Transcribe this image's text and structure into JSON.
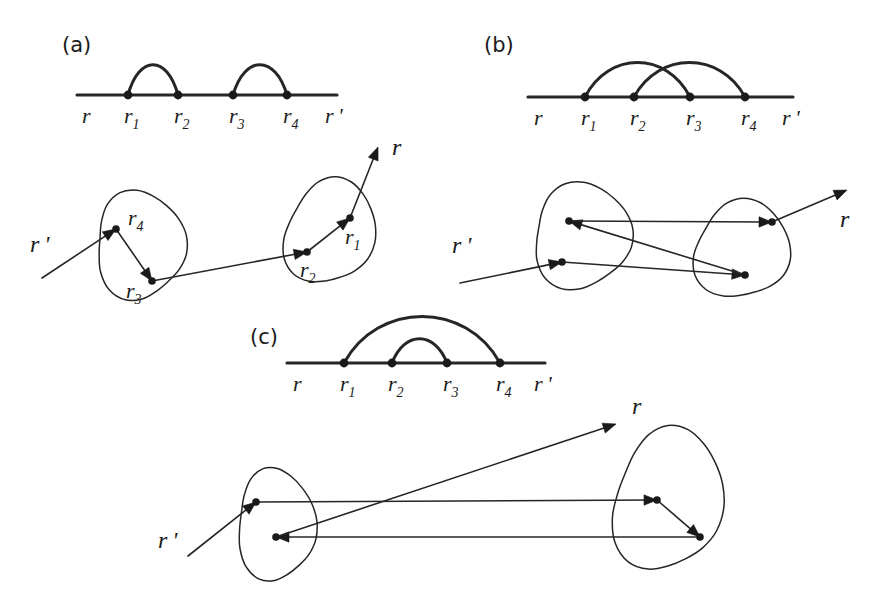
{
  "figure": {
    "background_color": "#ffffff",
    "ink_color": "#1a1a1a",
    "width": 886,
    "height": 602
  },
  "panels": [
    {
      "id": "a",
      "label": "(a)",
      "label_pos": {
        "x": 62,
        "y": 52
      },
      "topology": "non-crossing-sequential",
      "diagram": {
        "baseline": {
          "x1": 77,
          "y": 95,
          "x2": 337
        },
        "vertices": [
          {
            "name": "r1",
            "x": 128,
            "y": 95,
            "label": "r",
            "sub": "1",
            "label_x": 124,
            "label_y": 123
          },
          {
            "name": "r2",
            "x": 178,
            "y": 95,
            "label": "r",
            "sub": "2",
            "label_x": 174,
            "label_y": 123
          },
          {
            "name": "r3",
            "x": 233,
            "y": 95,
            "label": "r",
            "sub": "3",
            "label_x": 229,
            "label_y": 123
          },
          {
            "name": "r4",
            "x": 287,
            "y": 95,
            "label": "r",
            "sub": "4",
            "label_x": 283,
            "label_y": 123
          }
        ],
        "end_labels": [
          {
            "name": "r",
            "text": "r",
            "prime": false,
            "x": 82,
            "y": 123
          },
          {
            "name": "r-prime",
            "text": "r",
            "prime": true,
            "x": 325,
            "y": 123
          }
        ],
        "arcs": [
          {
            "from": "r1",
            "to": "r2",
            "height": 30
          },
          {
            "from": "r3",
            "to": "r4",
            "height": 30
          }
        ]
      },
      "scattering": {
        "blobs": [
          {
            "name": "left-blob",
            "cx": 140,
            "cy": 245,
            "rx": 46,
            "ry": 52,
            "rotate": -12,
            "wobble": 0.14
          },
          {
            "name": "right-blob",
            "cx": 330,
            "cy": 232,
            "rx": 45,
            "ry": 52,
            "rotate": 14,
            "wobble": 0.12
          }
        ],
        "sites": [
          {
            "name": "r4",
            "x": 116,
            "y": 229,
            "label": "r",
            "sub": "4",
            "label_x": 128,
            "label_y": 225
          },
          {
            "name": "r3",
            "x": 152,
            "y": 281,
            "label": "r",
            "sub": "3",
            "label_x": 126,
            "label_y": 298
          },
          {
            "name": "r2",
            "x": 307,
            "y": 252,
            "label": "r",
            "sub": "2",
            "label_x": 300,
            "label_y": 277
          },
          {
            "name": "r1",
            "x": 350,
            "y": 218,
            "label": "r",
            "sub": "1",
            "label_x": 345,
            "label_y": 244
          }
        ],
        "rays": [
          {
            "name": "incoming-ray",
            "x1": 42,
            "y1": 278,
            "x2": 116,
            "y2": 229,
            "arrow": true
          },
          {
            "name": "hop-r4-r3",
            "x1": 116,
            "y1": 229,
            "x2": 152,
            "y2": 281,
            "arrow": true
          },
          {
            "name": "hop-r3-r2",
            "x1": 152,
            "y1": 281,
            "x2": 307,
            "y2": 252,
            "arrow": true
          },
          {
            "name": "hop-r2-r1",
            "x1": 307,
            "y1": 252,
            "x2": 350,
            "y2": 218,
            "arrow": true
          },
          {
            "name": "outgoing-ray",
            "x1": 350,
            "y1": 218,
            "x2": 378,
            "y2": 147,
            "arrow": true
          }
        ],
        "end_labels": [
          {
            "name": "r-prime-in",
            "text": "r",
            "prime": true,
            "x": 30,
            "y": 252
          },
          {
            "name": "r-out",
            "text": "r",
            "prime": false,
            "x": 392,
            "y": 155
          }
        ]
      }
    },
    {
      "id": "b",
      "label": "(b)",
      "label_pos": {
        "x": 484,
        "y": 52
      },
      "topology": "crossing",
      "diagram": {
        "baseline": {
          "x1": 528,
          "y": 97,
          "x2": 793
        },
        "vertices": [
          {
            "name": "r1",
            "x": 585,
            "y": 97,
            "label": "r",
            "sub": "1",
            "label_x": 581,
            "label_y": 125
          },
          {
            "name": "r2",
            "x": 634,
            "y": 97,
            "label": "r",
            "sub": "2",
            "label_x": 630,
            "label_y": 125
          },
          {
            "name": "r3",
            "x": 690,
            "y": 97,
            "label": "r",
            "sub": "3",
            "label_x": 686,
            "label_y": 125
          },
          {
            "name": "r4",
            "x": 745,
            "y": 97,
            "label": "r",
            "sub": "4",
            "label_x": 741,
            "label_y": 125
          }
        ],
        "end_labels": [
          {
            "name": "r",
            "text": "r",
            "prime": false,
            "x": 534,
            "y": 125
          },
          {
            "name": "r-prime",
            "text": "r",
            "prime": true,
            "x": 782,
            "y": 125
          }
        ],
        "arcs": [
          {
            "from": "r1",
            "to": "r3",
            "height": 34
          },
          {
            "from": "r2",
            "to": "r4",
            "height": 34
          }
        ]
      },
      "scattering": {
        "blobs": [
          {
            "name": "left-blob",
            "cx": 582,
            "cy": 236,
            "rx": 50,
            "ry": 51,
            "rotate": -8,
            "wobble": 0.13
          },
          {
            "name": "right-blob",
            "cx": 742,
            "cy": 250,
            "rx": 48,
            "ry": 48,
            "rotate": 12,
            "wobble": 0.13
          }
        ],
        "sites": [
          {
            "name": "site-left-top",
            "x": 569,
            "y": 221
          },
          {
            "name": "site-left-bottom",
            "x": 562,
            "y": 262
          },
          {
            "name": "site-right-top",
            "x": 772,
            "y": 222
          },
          {
            "name": "site-right-bottom",
            "x": 745,
            "y": 275
          }
        ],
        "rays": [
          {
            "name": "incoming-ray",
            "x1": 460,
            "y1": 283,
            "x2": 562,
            "y2": 262,
            "arrow": true
          },
          {
            "name": "hop-leftbottom-rightbottom",
            "x1": 562,
            "y1": 262,
            "x2": 745,
            "y2": 275,
            "arrow": true
          },
          {
            "name": "hop-rightbottom-lefttop",
            "x1": 745,
            "y1": 275,
            "x2": 569,
            "y2": 221,
            "arrow": true
          },
          {
            "name": "hop-lefttop-righttop",
            "x1": 569,
            "y1": 221,
            "x2": 772,
            "y2": 222,
            "arrow": true
          },
          {
            "name": "outgoing-ray",
            "x1": 772,
            "y1": 222,
            "x2": 847,
            "y2": 190,
            "arrow": true
          }
        ],
        "end_labels": [
          {
            "name": "r-prime-in",
            "text": "r",
            "prime": true,
            "x": 452,
            "y": 253
          },
          {
            "name": "r-out",
            "text": "r",
            "prime": false,
            "x": 840,
            "y": 227
          }
        ]
      }
    },
    {
      "id": "c",
      "label": "(c)",
      "label_pos": {
        "x": 250,
        "y": 344
      },
      "topology": "nested",
      "diagram": {
        "baseline": {
          "x1": 287,
          "y": 363,
          "x2": 545
        },
        "vertices": [
          {
            "name": "r1",
            "x": 344,
            "y": 363,
            "label": "r",
            "sub": "1",
            "label_x": 340,
            "label_y": 391
          },
          {
            "name": "r2",
            "x": 392,
            "y": 363,
            "label": "r",
            "sub": "2",
            "label_x": 388,
            "label_y": 391
          },
          {
            "name": "r3",
            "x": 447,
            "y": 363,
            "label": "r",
            "sub": "3",
            "label_x": 443,
            "label_y": 391
          },
          {
            "name": "r4",
            "x": 500,
            "y": 363,
            "label": "r",
            "sub": "4",
            "label_x": 496,
            "label_y": 391
          }
        ],
        "end_labels": [
          {
            "name": "r",
            "text": "r",
            "prime": false,
            "x": 293,
            "y": 391
          },
          {
            "name": "r-prime",
            "text": "r",
            "prime": true,
            "x": 534,
            "y": 391
          }
        ],
        "arcs": [
          {
            "from": "r1",
            "to": "r4",
            "height": 46
          },
          {
            "from": "r2",
            "to": "r3",
            "height": 24
          }
        ]
      },
      "scattering": {
        "blobs": [
          {
            "name": "left-blob",
            "cx": 276,
            "cy": 525,
            "rx": 40,
            "ry": 54,
            "rotate": -6,
            "wobble": 0.13
          },
          {
            "name": "right-blob",
            "cx": 668,
            "cy": 500,
            "rx": 55,
            "ry": 70,
            "rotate": 8,
            "wobble": 0.12
          }
        ],
        "sites": [
          {
            "name": "site-left-top",
            "x": 256,
            "y": 502
          },
          {
            "name": "site-left-bottom",
            "x": 276,
            "y": 537
          },
          {
            "name": "site-right-top",
            "x": 657,
            "y": 500
          },
          {
            "name": "site-right-bottom",
            "x": 700,
            "y": 537
          }
        ],
        "rays": [
          {
            "name": "incoming-ray",
            "x1": 188,
            "y1": 556,
            "x2": 256,
            "y2": 502,
            "arrow": true
          },
          {
            "name": "hop-lefttop-righttop",
            "x1": 256,
            "y1": 502,
            "x2": 657,
            "y2": 500,
            "arrow": true
          },
          {
            "name": "hop-righttop-rightbottom",
            "x1": 657,
            "y1": 500,
            "x2": 700,
            "y2": 537,
            "arrow": true
          },
          {
            "name": "hop-rightbottom-leftbottom",
            "x1": 700,
            "y1": 537,
            "x2": 276,
            "y2": 537,
            "arrow": true
          },
          {
            "name": "outgoing-ray",
            "x1": 276,
            "y1": 537,
            "x2": 616,
            "y2": 424,
            "arrow": true
          }
        ],
        "end_labels": [
          {
            "name": "r-prime-in",
            "text": "r",
            "prime": true,
            "x": 158,
            "y": 548
          },
          {
            "name": "r-out",
            "text": "r",
            "prime": false,
            "x": 632,
            "y": 414
          }
        ]
      }
    }
  ]
}
